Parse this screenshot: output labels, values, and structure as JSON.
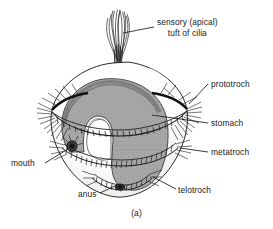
{
  "figure": {
    "caption": "(a)",
    "background_color": "#ffffff",
    "ink_color": "#1a1a1a",
    "body_fill_color": "#ffffff",
    "stomach_fill_color": "#a8a8a8",
    "cilia_band_color": "#2b2b2b"
  },
  "labels": [
    {
      "id": "sensory-tuft",
      "line1": "sensory (apical)",
      "line2": "tuft of cilia",
      "x": 157,
      "y": 22
    },
    {
      "id": "prototroch",
      "text": "prototroch",
      "x": 211,
      "y": 83
    },
    {
      "id": "stomach",
      "text": "stomach",
      "x": 211,
      "y": 122
    },
    {
      "id": "metatroch",
      "text": "metatroch",
      "x": 211,
      "y": 151
    },
    {
      "id": "telotroch",
      "text": "telotroch",
      "x": 178,
      "y": 190
    },
    {
      "id": "mouth",
      "text": "mouth",
      "x": 11,
      "y": 162
    },
    {
      "id": "anus",
      "text": "anus",
      "x": 78,
      "y": 194
    }
  ]
}
